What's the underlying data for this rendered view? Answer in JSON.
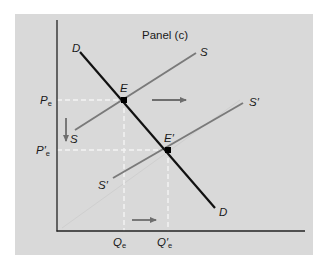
{
  "diagram": {
    "title": "Panel (c)",
    "type": "supply-demand",
    "colors": {
      "background": "#d9d9d9",
      "page": "#ffffff",
      "demand": "#111111",
      "supply": "#7a7a7a",
      "arrows": "#6e6e6e",
      "guides": "#f2f2f2",
      "axes": "#222222"
    },
    "curves": {
      "demand": {
        "label_start": "D",
        "label_end": "D"
      },
      "supply": {
        "label_start": "S",
        "label_end": "S"
      },
      "supply_shifted": {
        "label_start": "S′",
        "label_end": "S′"
      }
    },
    "points": {
      "equilibrium": {
        "label": "E"
      },
      "new_equilibrium": {
        "label": "E′"
      }
    },
    "axis_labels": {
      "price_initial": {
        "main": "P",
        "sub": "e"
      },
      "price_new": {
        "main": "P′",
        "sub": "e"
      },
      "quantity_initial": {
        "main": "Q",
        "sub": "e"
      },
      "quantity_new": {
        "main": "Q′",
        "sub": "e"
      }
    },
    "arrows": [
      {
        "name": "supply-shift-arrow",
        "direction": "right"
      },
      {
        "name": "price-fall-arrow",
        "direction": "down"
      },
      {
        "name": "quantity-increase-arrow",
        "direction": "right"
      }
    ]
  }
}
